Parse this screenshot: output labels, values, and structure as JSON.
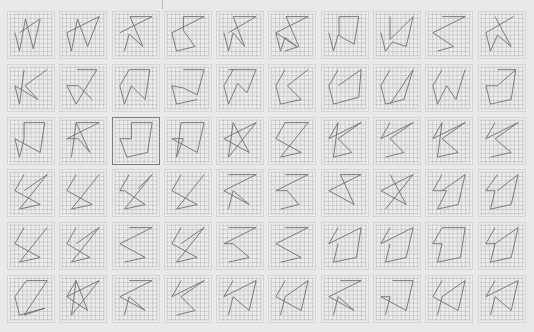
{
  "header": {
    "left_label": "· · · · ·",
    "right_label": "· · · ·"
  },
  "board": {
    "rows": 6,
    "columns": 10,
    "grid_cells": 10,
    "line_color": "#6f6f6f",
    "grid_color": "#b2b2b2",
    "tile_bg": "#ececec",
    "selected_border": "#7d7d7d",
    "selected_index": 22
  },
  "tiles": [
    {
      "pts": "2.5,4.5 7,1.5 5.5,8 3.8,1.5 2.5,8.5 1.5,4.5"
    },
    {
      "pts": "1.5,4.5 8.5,1 6,7.5 3.8,1.5 2.5,8.5 1.5,4.5"
    },
    {
      "pts": "1.5,4.5 8.5,1 3.7,1 6.5,7.5 3.5,4.8 2.5,8.5"
    },
    {
      "pts": "4,1 8.5,1 1.5,4.5 2.5,8.5 6.5,7.5 4,4 4,1"
    },
    {
      "pts": "2.5,4.5 8.5,1 3.5,1 6,7.5 3.5,4.5 2.5,8.5 1.5,4.5"
    },
    {
      "pts": "1.5,4.5 6,7.5 3.5,5.5 2.5,8.5 1.5,4.5 8.5,1 3.7,1 6.5,7.5 3.5,8.5"
    },
    {
      "pts": "1.5,4.5 2.5,8.5 3.5,5 7,7 8,1 3.7,1 3.7,5"
    },
    {
      "pts": "1.5,4.5 2.5,8.5 4,6.5 7,7.5 8.5,1 3.5,6 3.5,1"
    },
    {
      "pts": "3.5,1 8.5,1 1.5,4.5 6,7.5 2.5,8.5"
    },
    {
      "pts": "7.5,1 1.5,4.5 2.5,8.5 4,5 7,7.5 3.5,1"
    },
    {
      "pts": "8.5,1 3.7,4.5 6.5,7.5 1.5,4.5 2.5,8.5 3.5,1 3.5,1"
    },
    {
      "pts": "3.7,1 8,1 3.5,8.5 1.5,4.5 4,4.5 7,7.5"
    },
    {
      "pts": "3.5,1 8,1 7,7.5 4,4.5 2.5,8.5 1.5,4.5 3.5,1"
    },
    {
      "pts": "4,1 8.5,1 7,6.5 4,5 1.5,4.5 2.5,8.5 7,7.5"
    },
    {
      "pts": "2.5,1 8.5,1 6.5,6 4.5,4 2.5,8.5 1.5,4.5 3.5,1"
    },
    {
      "pts": "3.5,1 1.5,4.5 2.5,8.5 7,7.5 4,4.5 8.5,1"
    },
    {
      "pts": "3.5,1 1.5,4.5 2.5,8.5 8,7 8.5,1 3.5,4.5"
    },
    {
      "pts": "3.5,1 1.5,4.5 2.5,8.5 6.5,7.5 8.5,1 3.5,8.5"
    },
    {
      "pts": "3.5,1 1.5,4.5 2.5,8.5 4.5,4.5 6.5,7.5 8.5,1"
    },
    {
      "pts": "4,1 8,1 4,4.5 1.5,4.5 2.5,8.5 7,7.5 8,1"
    },
    {
      "pts": "3.5,1 8,1 7,7.5 1.5,4.5 2.5,8.5 3.5,4.5 3.5,1"
    },
    {
      "pts": "3.5,1 8.5,1 1.5,4.5 4,4.5 6.5,7.5 3.5,1 2.5,8.5"
    },
    {
      "pts": "4,4.5 4,1 8.5,1 7.5,7.5 3,8.5 1.5,4.5 4,4.5"
    },
    {
      "pts": "3.5,1 8.5,1 7,7.5 1.5,4.5 4,4.5 2.5,8.5 3.5,1"
    },
    {
      "pts": "3.5,1 7,7.5 1.5,4.5 8.5,1 2.5,8.5 3.5,1"
    },
    {
      "pts": "3.5,1 1.5,4.5 7,7.5 2.5,8.5 8.5,1 3.5,1"
    },
    {
      "pts": "3.5,1 1.5,4.5 8.5,1 3.5,4.5 6.5,7.5 2.5,8.5 3.5,1"
    },
    {
      "pts": "3.5,1 1.5,4.5 8.5,1 3.5,4.5 6.5,7.5 2.5,8.5"
    },
    {
      "pts": "3.5,1 1.5,4.5 8.5,1 3.5,4.5 7,7.5 2.5,8.5 3.5,1"
    },
    {
      "pts": "3.5,1 1.5,4.5 8.5,1 3.5,4.5 7,7.5 2.5,8.5"
    },
    {
      "pts": "3.5,1 1.5,4.5 7,7.5 2.5,8.5 8.5,1 3.5,4.5"
    },
    {
      "pts": "3.5,1 1.5,4.5 7,7.5 2.5,8.5 8.5,1"
    },
    {
      "pts": "3.5,1 1.5,4.5 2.5,4.5 7,7.5 2.5,8.5 8.5,1 5.5,4"
    },
    {
      "pts": "3.5,1 1.5,4.5 7,7.5 2.5,8.5 8.5,1"
    },
    {
      "pts": "2.5,1 8.5,1 1.5,4.5 7,7.5 3.5,4.5 2.5,8.5"
    },
    {
      "pts": "3.5,1 8.5,1 1.5,4.5 4,4.5 6.5,7.5 2.5,8.5"
    },
    {
      "pts": "4,1 8.5,1 1.5,4.5 7,7.5 4,1"
    },
    {
      "pts": "3.5,1 7,7.5 1.5,4.5 8.5,1 2.5,8.5"
    },
    {
      "pts": "3.5,1 1.5,4.5 4.5,4.5 2.5,8.5 7,7.5 8.5,1 3.5,4.5"
    },
    {
      "pts": "4,1 1.5,4.5 3.5,4.5 2.5,8.5 7,7.5 8.5,1 4,4.5"
    },
    {
      "pts": "3.5,1 1.5,4.5 7,7.5 2.5,8.5 8.5,1"
    },
    {
      "pts": "3.5,1 1.5,4.5 6.5,7.5 2.5,8.5 8.5,1 3.5,4.5"
    },
    {
      "pts": "3.5,1 8.5,1 1.5,4.5 7,7.5 2.5,8.5"
    },
    {
      "pts": "3.5,1 1.5,4.5 7,7.5 2.5,8.5 8.5,1 3.5,4.5"
    },
    {
      "pts": "2.5,1 8.5,1 1.5,4.5 3.5,4.5 7,7.5 2.5,8.5"
    },
    {
      "pts": "3.5,1 8.5,1 1.5,4.5 7,7.5 2.5,8.5"
    },
    {
      "pts": "3.5,1 1.5,4.5 8.5,1 7.5,7.5 2.5,8.5 3.5,4.5"
    },
    {
      "pts": "3.5,1 1.5,4.5 8.5,1 7,7.5 2.5,8.5 3.5,4.5"
    },
    {
      "pts": "3.5,1 8.5,1 7.5,7.5 2.5,8.5 3.5,4.5 1.5,4.5 3.5,1"
    },
    {
      "pts": "3.5,1 1.5,4.5 3.5,4.5 2.5,8.5 7,7.5 8.5,1 3.5,4.5"
    },
    {
      "pts": "4,1 1.5,4.5 2.5,8.5 8,7 3.5,8.5 8.5,1 4,1"
    },
    {
      "pts": "3.5,1 1.5,4.5 8.5,1 2.5,8.5 3.5,1 6,7.5 1.5,4.5"
    },
    {
      "pts": "3.5,1 8.5,1 1.5,4.5 7,7.5 3.5,4.5 2.5,8.5"
    },
    {
      "pts": "3.5,1 1.5,4.5 8.5,1 3.5,4.5 6.5,7.5 2.5,8.5"
    },
    {
      "pts": "3.5,1 1.5,4.5 8.5,1 7,7.5 3.5,4.5 2.5,8.5"
    },
    {
      "pts": "3.5,1 1.5,4.5 7,7.5 8.5,1 3.5,4.5 2.5,8.5"
    },
    {
      "pts": "4,1 8.5,1 1.5,4.5 7,7.5 3.5,4.5 2.5,8.5"
    },
    {
      "pts": "4,1 8.5,1 7,7.5 1.5,4.5 3.5,4.5 2.5,8.5"
    },
    {
      "pts": "3.5,1 1.5,4.5 7,7.5 8.5,1 3.5,4.5 2.5,8.5"
    },
    {
      "pts": "3.5,1 1.5,4.5 8.5,1 7,7.5 3.5,4.5 3.5,4.5 2.5,8.5"
    }
  ]
}
